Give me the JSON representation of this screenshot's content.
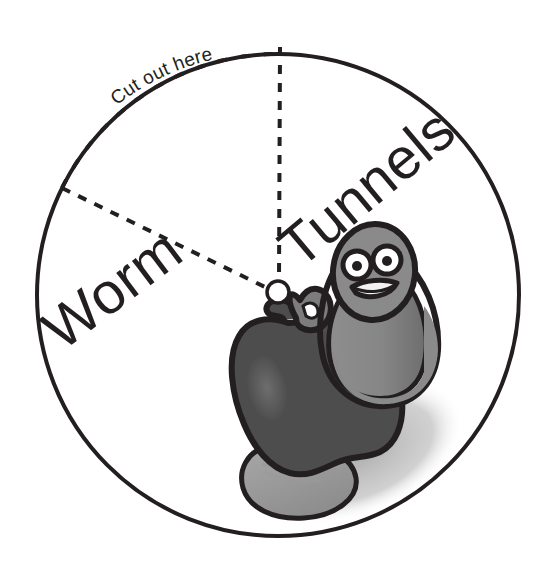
{
  "figure": {
    "type": "paper-spinner-wheel",
    "title_text": "",
    "background_color": "#ffffff",
    "outline_color": "#231f20",
    "circle": {
      "center_x": 278,
      "center_y": 295,
      "radius": 241,
      "stroke_width": 4
    },
    "pivot": {
      "label": "pivot-hole",
      "center_x": 278,
      "center_y": 292,
      "radius": 11,
      "stroke_width": 3
    }
  },
  "labels": {
    "sector_left": "Worm",
    "sector_right": "Tunnels",
    "cut_instruction": "Cut out here"
  },
  "guides": {
    "vertical_dashed": {
      "name": "dashed-radius-up",
      "from_x": 280,
      "from_y": 47,
      "to_x": 279,
      "to_y": 281
    },
    "diagonal_dashed": {
      "name": "dashed-radius-upper-left",
      "from_x": 62,
      "from_y": 188,
      "to_x": 268,
      "to_y": 288
    },
    "dotted_arc": {
      "name": "dotted-cut-arc",
      "start_angle_deg": 180,
      "end_angle_deg": 270,
      "dot_count": 13
    }
  },
  "illustration": {
    "name": "worm-in-apple",
    "parts": [
      "drop-shadow",
      "worm-tail",
      "apple-body",
      "apple-highlight",
      "apple-leaf",
      "apple-stem",
      "worm-body",
      "worm-head",
      "worm-eye-left",
      "worm-eye-right",
      "worm-mouth"
    ]
  },
  "colors": {
    "ink": "#231f20",
    "apple_body": "#4d4d4d",
    "apple_highlight": "#6b6b6b",
    "worm_body": "#8a8a8a",
    "worm_shade": "#6f6f6f",
    "shadow": "#b3b3b3",
    "eye_white": "#ffffff",
    "paper": "#ffffff"
  }
}
